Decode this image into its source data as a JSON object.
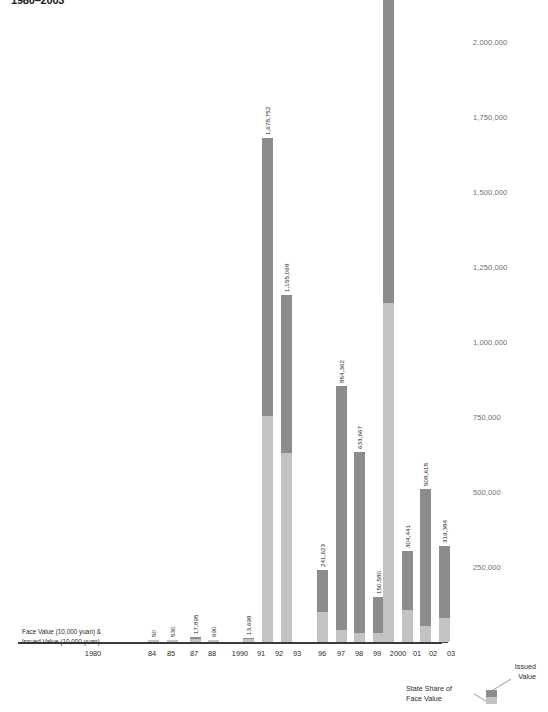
{
  "title": "1980–2003",
  "axis_caption": "Face Value (10,000 yuan) &\nIssued Value (10,000 yuan)",
  "legend": {
    "issued_label": "Issued\nValue",
    "state_label": "State Share of\nFace Value",
    "face_color": "#8c8c8c",
    "issued_color": "#c3c3c3"
  },
  "y_ticks": [
    "2,000,000",
    "1,750,000",
    "1,500,000",
    "1,250,000",
    "1,000,000",
    "750,000",
    "500,000",
    "250,000"
  ],
  "chart_data": {
    "type": "bar",
    "title": "1980–2003",
    "xlabel": "",
    "ylabel": "Face Value (10,000 yuan) & Issued Value (10,000 yuan)",
    "ylim": [
      0,
      2250000
    ],
    "ytick_values": [
      2000000,
      1750000,
      1500000,
      1250000,
      1000000,
      750000,
      500000,
      250000
    ],
    "grid": false,
    "legend_position": "bottom-right",
    "stacked": true,
    "categories": [
      "1980",
      "84",
      "85",
      "87",
      "88",
      "1990",
      "91",
      "92",
      "93",
      "96",
      "97",
      "98",
      "99",
      "2000",
      "01",
      "02",
      "03"
    ],
    "series": [
      {
        "name": "Face Value",
        "values": [
          0,
          50,
          530,
          17895,
          690,
          0,
          13698,
          1678752,
          1155068,
          241623,
          854362,
          633667,
          150580,
          2242886,
          304441,
          508618,
          319384
        ]
      },
      {
        "name": "Issued Value (State Share of Face Value)",
        "values": [
          0,
          50,
          530,
          17895,
          690,
          0,
          13698,
          753000,
          630000,
          100000,
          40000,
          30000,
          30000,
          1130000,
          108000,
          53000,
          80000
        ]
      }
    ],
    "bar_labels": [
      "",
      "50",
      "530",
      "17,895",
      "690",
      "",
      "13,698",
      "1,678,752",
      "1,155,068",
      "241,623",
      "854,362",
      "633,667",
      "150,580",
      "2,242,886",
      "304,441",
      "508,618",
      "319,384"
    ]
  },
  "bars": [
    {
      "key": "1980",
      "label": "",
      "x": 80,
      "face": 0,
      "issued": 0
    },
    {
      "key": "84",
      "label": "50",
      "x": 148,
      "face": 50,
      "issued": 50
    },
    {
      "key": "85",
      "label": "530",
      "x": 167,
      "face": 530,
      "issued": 530
    },
    {
      "key": "87",
      "label": "17,895",
      "x": 190,
      "face": 17895,
      "issued": 11000
    },
    {
      "key": "88",
      "label": "690",
      "x": 208,
      "face": 690,
      "issued": 690
    },
    {
      "key": "1990",
      "label": "",
      "x": 228,
      "face": 0,
      "issued": 0
    },
    {
      "key": "91",
      "label": "13,698",
      "x": 243,
      "face": 13698,
      "issued": 9000
    },
    {
      "key": "92",
      "label": "1,678,752",
      "x": 262,
      "face": 1678752,
      "issued": 753000
    },
    {
      "key": "93",
      "label": "1,155,068",
      "x": 281,
      "face": 1155068,
      "issued": 630000
    },
    {
      "key": "96",
      "label": "241,623",
      "x": 317,
      "face": 241623,
      "issued": 100000
    },
    {
      "key": "97",
      "label": "854,362",
      "x": 336,
      "face": 854362,
      "issued": 40000
    },
    {
      "key": "98",
      "label": "633,667",
      "x": 354,
      "face": 633667,
      "issued": 30000
    },
    {
      "key": "99",
      "label": "150,580",
      "x": 373,
      "face": 150580,
      "issued": 30000
    },
    {
      "key": "2000",
      "label": "2,242,886",
      "x": 383,
      "face": 2242886,
      "issued": 1130000
    },
    {
      "key": "01",
      "label": "304,441",
      "x": 402,
      "face": 304441,
      "issued": 108000
    },
    {
      "key": "02",
      "label": "508,618",
      "x": 420,
      "face": 508618,
      "issued": 53000
    },
    {
      "key": "03",
      "label": "319,384",
      "x": 439,
      "face": 319384,
      "issued": 80000
    }
  ],
  "x_ticks": [
    {
      "label": "1980",
      "x": 93
    },
    {
      "label": "84",
      "x": 152
    },
    {
      "label": "85",
      "x": 171
    },
    {
      "label": "87",
      "x": 194
    },
    {
      "label": "88",
      "x": 212
    },
    {
      "label": "1990",
      "x": 240
    },
    {
      "label": "91",
      "x": 261
    },
    {
      "label": "92",
      "x": 279
    },
    {
      "label": "93",
      "x": 297
    },
    {
      "label": "96",
      "x": 322
    },
    {
      "label": "97",
      "x": 341
    },
    {
      "label": "98",
      "x": 359
    },
    {
      "label": "99",
      "x": 377
    },
    {
      "label": "2000",
      "x": 398
    },
    {
      "label": "01",
      "x": 417
    },
    {
      "label": "02",
      "x": 433
    },
    {
      "label": "03",
      "x": 451
    }
  ]
}
